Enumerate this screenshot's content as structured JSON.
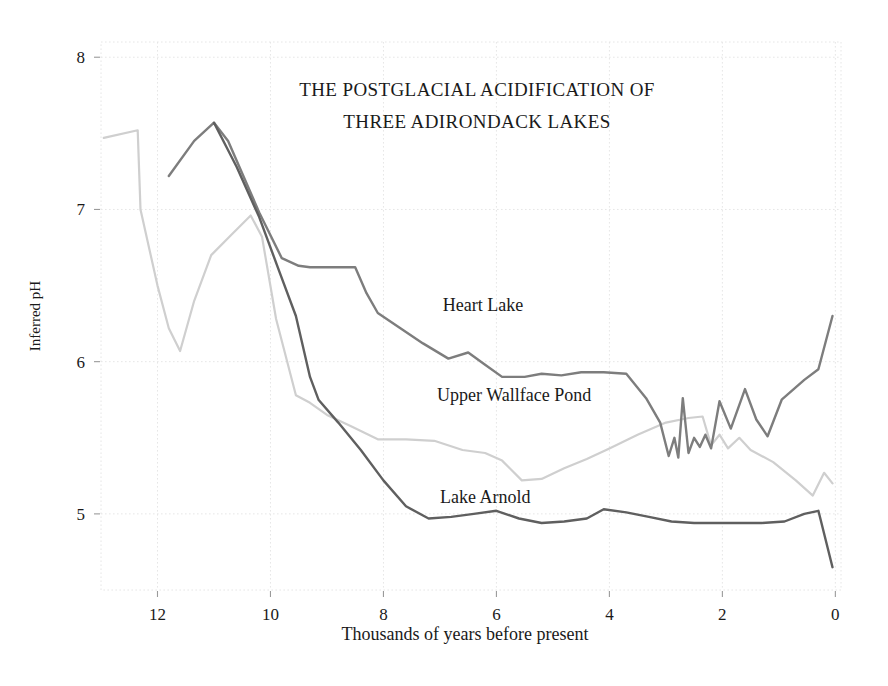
{
  "chart_data": {
    "type": "line",
    "title": "THE POSTGLACIAL ACIDIFICATION OF THREE ADIRONDACK LAKES",
    "title_lines": [
      "THE POSTGLACIAL ACIDIFICATION OF",
      "THREE ADIRONDACK LAKES"
    ],
    "xlabel": "Thousands of years before present",
    "ylabel": "Inferred pH",
    "xlim": [
      13.0,
      -0.1
    ],
    "ylim": [
      4.5,
      8.1
    ],
    "x_ticks": [
      12,
      10,
      8,
      6,
      4,
      2,
      0
    ],
    "x_tick_labels": [
      "12",
      "10",
      "8",
      "6",
      "4",
      "2",
      "0"
    ],
    "y_ticks": [
      5,
      6,
      7,
      8
    ],
    "y_tick_labels": [
      "5",
      "6",
      "7",
      "8"
    ],
    "x_axis_reversed": true,
    "grid": true,
    "legend_position": "inline-annotations",
    "series": [
      {
        "name": "Heart Lake",
        "color": "#7d7d7d",
        "label_x": 6.95,
        "label_y": 6.33,
        "points": [
          [
            11.8,
            7.22
          ],
          [
            11.35,
            7.45
          ],
          [
            11.0,
            7.57
          ],
          [
            10.75,
            7.45
          ],
          [
            10.2,
            6.98
          ],
          [
            9.8,
            6.68
          ],
          [
            9.5,
            6.63
          ],
          [
            9.3,
            6.62
          ],
          [
            8.95,
            6.62
          ],
          [
            8.5,
            6.62
          ],
          [
            8.3,
            6.45
          ],
          [
            8.1,
            6.32
          ],
          [
            7.7,
            6.22
          ],
          [
            7.3,
            6.12
          ],
          [
            6.85,
            6.02
          ],
          [
            6.5,
            6.06
          ],
          [
            6.2,
            5.98
          ],
          [
            5.9,
            5.9
          ],
          [
            5.5,
            5.9
          ],
          [
            5.2,
            5.92
          ],
          [
            4.85,
            5.91
          ],
          [
            4.5,
            5.93
          ],
          [
            4.1,
            5.93
          ],
          [
            3.7,
            5.92
          ],
          [
            3.35,
            5.76
          ],
          [
            3.1,
            5.6
          ],
          [
            2.95,
            5.38
          ],
          [
            2.85,
            5.5
          ],
          [
            2.78,
            5.37
          ],
          [
            2.7,
            5.76
          ],
          [
            2.6,
            5.4
          ],
          [
            2.5,
            5.5
          ],
          [
            2.4,
            5.44
          ],
          [
            2.3,
            5.52
          ],
          [
            2.2,
            5.43
          ],
          [
            2.05,
            5.74
          ],
          [
            1.85,
            5.56
          ],
          [
            1.6,
            5.82
          ],
          [
            1.4,
            5.62
          ],
          [
            1.2,
            5.51
          ],
          [
            0.95,
            5.75
          ],
          [
            0.55,
            5.88
          ],
          [
            0.3,
            5.95
          ],
          [
            0.05,
            6.3
          ]
        ]
      },
      {
        "name": "Upper Wallface Pond",
        "color": "#cfcfcf",
        "label_x": 7.05,
        "label_y": 5.74,
        "points": [
          [
            12.95,
            7.47
          ],
          [
            12.35,
            7.52
          ],
          [
            12.3,
            7.0
          ],
          [
            12.0,
            6.5
          ],
          [
            11.8,
            6.22
          ],
          [
            11.6,
            6.07
          ],
          [
            11.35,
            6.4
          ],
          [
            11.05,
            6.7
          ],
          [
            10.7,
            6.83
          ],
          [
            10.35,
            6.96
          ],
          [
            10.15,
            6.82
          ],
          [
            9.9,
            6.28
          ],
          [
            9.55,
            5.78
          ],
          [
            9.3,
            5.73
          ],
          [
            9.0,
            5.65
          ],
          [
            8.6,
            5.58
          ],
          [
            8.1,
            5.49
          ],
          [
            7.6,
            5.49
          ],
          [
            7.1,
            5.48
          ],
          [
            6.6,
            5.42
          ],
          [
            6.2,
            5.4
          ],
          [
            5.9,
            5.35
          ],
          [
            5.55,
            5.22
          ],
          [
            5.2,
            5.23
          ],
          [
            4.8,
            5.3
          ],
          [
            4.4,
            5.36
          ],
          [
            4.0,
            5.43
          ],
          [
            3.5,
            5.52
          ],
          [
            3.0,
            5.6
          ],
          [
            2.6,
            5.63
          ],
          [
            2.35,
            5.64
          ],
          [
            2.2,
            5.45
          ],
          [
            2.05,
            5.52
          ],
          [
            1.9,
            5.43
          ],
          [
            1.7,
            5.5
          ],
          [
            1.5,
            5.42
          ],
          [
            1.1,
            5.34
          ],
          [
            0.7,
            5.22
          ],
          [
            0.4,
            5.12
          ],
          [
            0.2,
            5.27
          ],
          [
            0.05,
            5.2
          ]
        ]
      },
      {
        "name": "Lake Arnold",
        "color": "#5f5f5f",
        "label_x": 7.0,
        "label_y": 5.07,
        "points": [
          [
            11.0,
            7.57
          ],
          [
            10.6,
            7.28
          ],
          [
            10.2,
            6.95
          ],
          [
            9.85,
            6.6
          ],
          [
            9.55,
            6.3
          ],
          [
            9.3,
            5.9
          ],
          [
            9.15,
            5.75
          ],
          [
            8.8,
            5.6
          ],
          [
            8.4,
            5.42
          ],
          [
            8.0,
            5.22
          ],
          [
            7.6,
            5.05
          ],
          [
            7.2,
            4.97
          ],
          [
            6.8,
            4.98
          ],
          [
            6.4,
            5.0
          ],
          [
            6.0,
            5.02
          ],
          [
            5.6,
            4.97
          ],
          [
            5.2,
            4.94
          ],
          [
            4.8,
            4.95
          ],
          [
            4.4,
            4.97
          ],
          [
            4.1,
            5.03
          ],
          [
            3.7,
            5.01
          ],
          [
            3.3,
            4.98
          ],
          [
            2.9,
            4.95
          ],
          [
            2.5,
            4.94
          ],
          [
            2.1,
            4.94
          ],
          [
            1.7,
            4.94
          ],
          [
            1.3,
            4.94
          ],
          [
            0.9,
            4.95
          ],
          [
            0.55,
            5.0
          ],
          [
            0.3,
            5.02
          ],
          [
            0.05,
            4.65
          ]
        ]
      }
    ]
  }
}
